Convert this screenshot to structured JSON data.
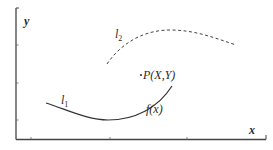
{
  "diagram": {
    "axes": {
      "x_label": "x",
      "y_label": "y",
      "color": "#444444"
    },
    "curves": [
      {
        "id": "l1",
        "label": "l",
        "subscript": "1",
        "style": "solid",
        "color": "#333333"
      },
      {
        "id": "l2",
        "label": "l",
        "subscript": "2",
        "style": "dashed",
        "color": "#444444"
      }
    ],
    "annotations": {
      "point_label": "P(X,Y)",
      "function_label": "f(x)"
    }
  }
}
